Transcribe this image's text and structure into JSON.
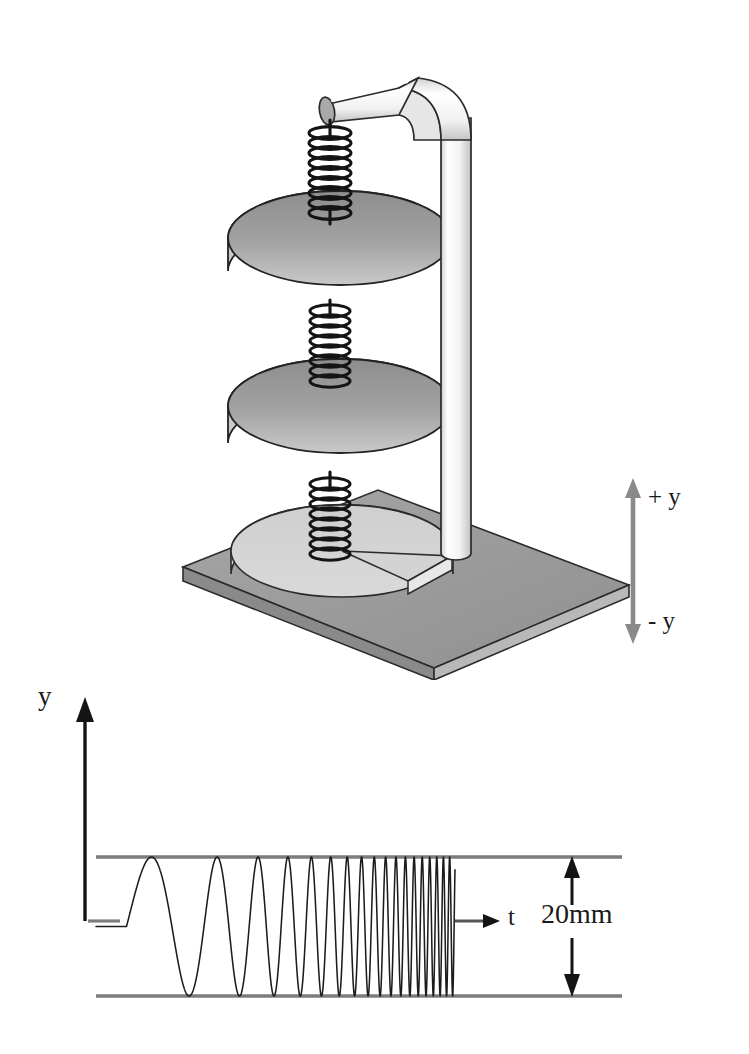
{
  "figure": {
    "background": "#ffffff"
  },
  "apparatus": {
    "name": "spring-mass-apparatus",
    "components": [
      {
        "id": "base-plate",
        "label": "base plate",
        "color": "#9a9a9a"
      },
      {
        "id": "base-disc",
        "label": "base disc",
        "color": "#d8d8d8"
      },
      {
        "id": "vertical-post",
        "label": "vertical post",
        "color": "#f2f2f2"
      },
      {
        "id": "horizontal-arm",
        "label": "horizontal arm",
        "color": "#efefef"
      },
      {
        "id": "upper-mass",
        "label": "upper mass disc",
        "color": "#9b9b9b"
      },
      {
        "id": "lower-mass",
        "label": "lower mass disc",
        "color": "#9b9b9b"
      },
      {
        "id": "spring-top",
        "label": "top spring",
        "color": "#141414"
      },
      {
        "id": "spring-middle",
        "label": "middle spring",
        "color": "#141414"
      },
      {
        "id": "spring-bottom",
        "label": "bottom spring",
        "color": "#141414"
      }
    ],
    "axis_indicator": {
      "name": "y-direction-indicator",
      "color": "#808080",
      "positive_label": "+ y",
      "negative_label": "- y"
    }
  },
  "chart_data": {
    "type": "line",
    "title": "",
    "xlabel": "t",
    "ylabel": "y",
    "annotation": "20mm",
    "grid": false,
    "legend": false,
    "axis_arrow_color": "#111111",
    "envelope_color": "#7d7d7d",
    "trace_color": "#1c1c1c",
    "peak_to_peak_mm": 20,
    "amplitude_mm": 10,
    "envelope_top_mm": 10,
    "envelope_bottom_mm": -10,
    "baseline_mm": 0,
    "sweep": {
      "start_flat_fraction": 0.085,
      "start_cycles_per_unit": 3.2,
      "end_cycles_per_unit": 62,
      "total_cycles": 46
    },
    "x": [
      0,
      0.05,
      0.085,
      0.12,
      0.2,
      0.3,
      0.4,
      0.5,
      0.6,
      0.7,
      0.8,
      0.9,
      1.0
    ],
    "cycle_peaks_y_mm": [
      0,
      0,
      0,
      10,
      -10,
      10,
      -10,
      10,
      -10,
      10,
      -10,
      10,
      -10
    ],
    "xlim": [
      0,
      1
    ],
    "ylim": [
      -10,
      10
    ]
  },
  "labels": {
    "axis_plus_y": "+ y",
    "axis_minus_y": "- y",
    "graph_y": "y",
    "graph_t": "t",
    "dimension": "20mm"
  }
}
